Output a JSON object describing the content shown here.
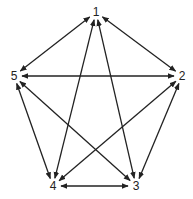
{
  "diagram": {
    "type": "directed-graph",
    "colors": {
      "stroke": "#222222",
      "label": "#222222",
      "background": "#ffffff"
    },
    "nodes": [
      {
        "id": "1",
        "label": "1",
        "x": 96,
        "y": 12
      },
      {
        "id": "2",
        "label": "2",
        "x": 182,
        "y": 76
      },
      {
        "id": "3",
        "label": "3",
        "x": 136,
        "y": 186
      },
      {
        "id": "4",
        "label": "4",
        "x": 53,
        "y": 186
      },
      {
        "id": "5",
        "label": "5",
        "x": 14,
        "y": 76
      }
    ],
    "edges": [
      {
        "from": "1",
        "to": "2",
        "bidirectional": true
      },
      {
        "from": "1",
        "to": "3",
        "bidirectional": true
      },
      {
        "from": "1",
        "to": "4",
        "bidirectional": true
      },
      {
        "from": "1",
        "to": "5",
        "bidirectional": true
      },
      {
        "from": "2",
        "to": "3",
        "bidirectional": true
      },
      {
        "from": "2",
        "to": "4",
        "bidirectional": true
      },
      {
        "from": "2",
        "to": "5",
        "bidirectional": true
      },
      {
        "from": "3",
        "to": "4",
        "bidirectional": true
      },
      {
        "from": "3",
        "to": "5",
        "bidirectional": true
      },
      {
        "from": "4",
        "to": "5",
        "bidirectional": true
      }
    ]
  }
}
